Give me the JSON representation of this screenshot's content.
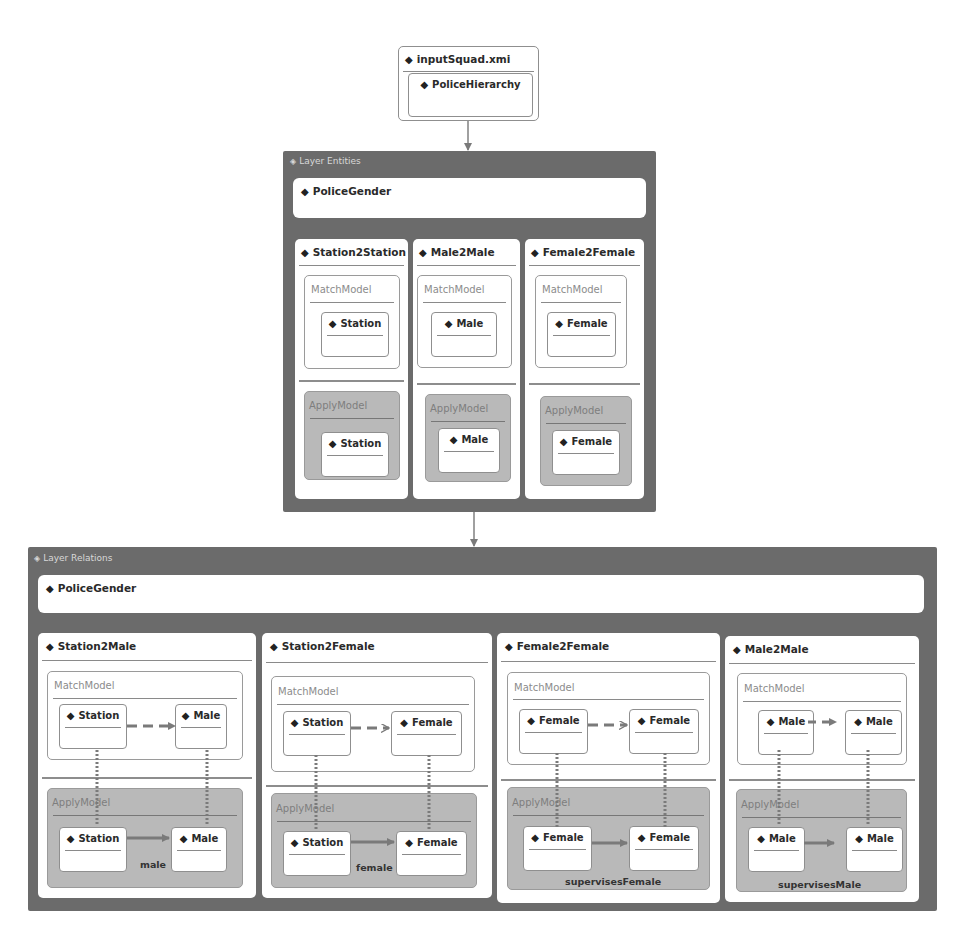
{
  "input": {
    "file": "inputSquad.xmi",
    "root": "PoliceHierarchy"
  },
  "layer_entities": {
    "label": "Layer Entities",
    "module": "PoliceGender",
    "rules": [
      {
        "name": "Station2Station",
        "match_label": "MatchModel",
        "apply_label": "ApplyModel",
        "match_node": "Station",
        "apply_node": "Station"
      },
      {
        "name": "Male2Male",
        "match_label": "MatchModel",
        "apply_label": "ApplyModel",
        "match_node": "Male",
        "apply_node": "Male"
      },
      {
        "name": "Female2Female",
        "match_label": "MatchModel",
        "apply_label": "ApplyModel",
        "match_node": "Female",
        "apply_node": "Female"
      }
    ]
  },
  "layer_relations": {
    "label": "Layer Relations",
    "module": "PoliceGender",
    "rules": [
      {
        "name": "Station2Male",
        "match_label": "MatchModel",
        "apply_label": "ApplyModel",
        "match_nodes": [
          "Station",
          "Male"
        ],
        "apply_nodes": [
          "Station",
          "Male"
        ],
        "relation": "male"
      },
      {
        "name": "Station2Female",
        "match_label": "MatchModel",
        "apply_label": "ApplyModel",
        "match_nodes": [
          "Station",
          "Female"
        ],
        "apply_nodes": [
          "Station",
          "Female"
        ],
        "relation": "female"
      },
      {
        "name": "Female2Female",
        "match_label": "MatchModel",
        "apply_label": "ApplyModel",
        "match_nodes": [
          "Female",
          "Female"
        ],
        "apply_nodes": [
          "Female",
          "Female"
        ],
        "relation": "supervisesFemale"
      },
      {
        "name": "Male2Male",
        "match_label": "MatchModel",
        "apply_label": "ApplyModel",
        "match_nodes": [
          "Male",
          "Male"
        ],
        "apply_nodes": [
          "Male",
          "Male"
        ],
        "relation": "supervisesMale"
      }
    ]
  },
  "icons": {
    "element": "diamond-icon",
    "layer": "diamond-outline-icon"
  },
  "colors": {
    "layer_bg": "#6b6b6b",
    "apply_bg": "#b9b9b9",
    "border": "#8f8f8f"
  }
}
